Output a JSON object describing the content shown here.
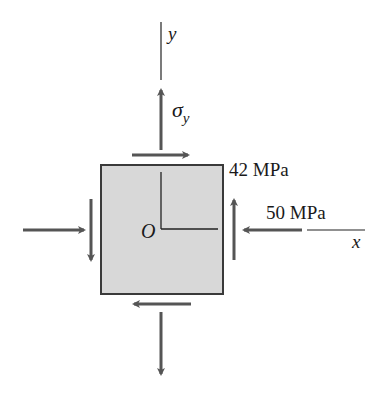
{
  "diagram": {
    "element": {
      "origin_label": "O",
      "fill": "#d8d8d8",
      "stroke": "#3a3a3a"
    },
    "axes": {
      "x_label": "x",
      "y_label": "y"
    },
    "stresses": {
      "sigma_y_symbol": "σ",
      "sigma_y_subscript": "y",
      "shear_label": "42 MPa",
      "normal_x_label": "50 MPa"
    },
    "arrow_color": "#555555",
    "line_color": "#222222"
  }
}
